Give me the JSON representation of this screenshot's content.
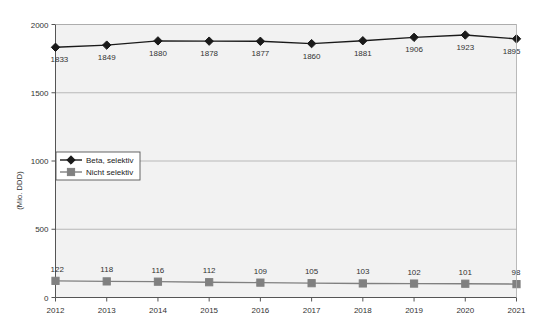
{
  "chart_data": {
    "type": "line",
    "title": "",
    "subtitle": "",
    "xlabel": "",
    "ylabel": "(Mio. DDD)",
    "categories": [
      "2012",
      "2013",
      "2014",
      "2015",
      "2016",
      "2017",
      "2018",
      "2019",
      "2020",
      "2021"
    ],
    "x": [
      2012,
      2013,
      2014,
      2015,
      2016,
      2017,
      2018,
      2019,
      2020,
      2021
    ],
    "series": [
      {
        "name": "Beta, selektiv",
        "marker": "diamond",
        "color": "#1a1a1a",
        "values": [
          1833,
          1849,
          1880,
          1878,
          1877,
          1860,
          1881,
          1906,
          1923,
          1895
        ]
      },
      {
        "name": "Nicht selektiv",
        "marker": "square",
        "color": "#808080",
        "values": [
          122,
          118,
          116,
          112,
          109,
          105,
          103,
          102,
          101,
          98
        ]
      }
    ],
    "ylim": [
      0,
      2000
    ],
    "yticks": [
      0,
      500,
      1000,
      1500,
      2000
    ],
    "ytick_labels": [
      "0",
      "500",
      "1000",
      "1500",
      "2000"
    ],
    "grid": true,
    "grid_axis": "y",
    "legend_position": "left-middle",
    "plot_background": "#f2f2f2",
    "grid_color": "#aaaaaa",
    "axis_color": "#555555"
  },
  "legend": {
    "entries": [
      {
        "label": "Beta, selektiv"
      },
      {
        "label": "Nicht selektiv"
      }
    ]
  }
}
